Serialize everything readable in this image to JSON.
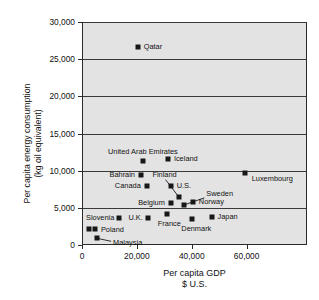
{
  "chart_data": {
    "type": "scatter",
    "title": "",
    "xlabel": "Per capita GDP",
    "xlabel_line2": "$ U.S.",
    "ylabel": "Per capita energy consumption",
    "ylabel_line2": "(kg oil equivalent)",
    "xlim": [
      0,
      82000
    ],
    "ylim": [
      0,
      30000
    ],
    "grid": "horizontal",
    "legend": "none",
    "xticks": [
      {
        "value": 0,
        "label": "0"
      },
      {
        "value": 20000,
        "label": "20,000"
      },
      {
        "value": 40000,
        "label": "40,000"
      },
      {
        "value": 60000,
        "label": "60,000"
      }
    ],
    "yticks": [
      {
        "value": 0,
        "label": "0"
      },
      {
        "value": 5000,
        "label": "5,000"
      },
      {
        "value": 10000,
        "label": "10,000"
      },
      {
        "value": 15000,
        "label": "15,000"
      },
      {
        "value": 20000,
        "label": "20,000"
      },
      {
        "value": 25000,
        "label": "25,000"
      },
      {
        "value": 30000,
        "label": "30,000"
      }
    ],
    "points": [
      {
        "name": "Qatar",
        "x": 20300,
        "y": 26700,
        "label": "Qatar",
        "label_pos": "l",
        "label_dx": 6,
        "label_dy": 0,
        "leader": null
      },
      {
        "name": "Iceland",
        "x": 31300,
        "y": 11600,
        "label": "Iceland",
        "label_pos": "l",
        "label_dx": 6,
        "label_dy": 0,
        "leader": null
      },
      {
        "name": "United Arab Emirates",
        "x": 22200,
        "y": 11250,
        "label": "United Arab Emirates",
        "label_pos": "c",
        "label_dx": 0,
        "label_dy": -9,
        "leader": null
      },
      {
        "name": "Luxembourg",
        "x": 59300,
        "y": 9650,
        "label": "Luxembourg",
        "label_pos": "l",
        "label_dx": 7,
        "label_dy": 6,
        "leader": null
      },
      {
        "name": "Bahrain",
        "x": 21500,
        "y": 9350,
        "label": "Bahrain",
        "label_pos": "r",
        "label_dx": -6,
        "label_dy": 0,
        "leader": null
      },
      {
        "name": "Canada",
        "x": 23600,
        "y": 8000,
        "label": "Canada",
        "label_pos": "r",
        "label_dx": -6,
        "label_dy": 0,
        "leader": null
      },
      {
        "name": "U.S.",
        "x": 32300,
        "y": 7900,
        "label": "U.S.",
        "label_pos": "l",
        "label_dx": 6,
        "label_dy": 0,
        "leader": null
      },
      {
        "name": "Finland",
        "x": 35200,
        "y": 6500,
        "label": "Finland",
        "label_pos": "c",
        "label_dx": -14,
        "label_dy": -22,
        "leader": "down-left"
      },
      {
        "name": "Belgium",
        "x": 32400,
        "y": 5600,
        "label": "Belgium",
        "label_pos": "r",
        "label_dx": -6,
        "label_dy": 0,
        "leader": null
      },
      {
        "name": "Sweden",
        "x": 37300,
        "y": 5400,
        "label": "Sweden",
        "label_pos": "l",
        "label_dx": 22,
        "label_dy": -11,
        "leader": "up-right"
      },
      {
        "name": "Norway",
        "x": 40400,
        "y": 5800,
        "label": "Norway",
        "label_pos": "l",
        "label_dx": 6,
        "label_dy": 0,
        "leader": null
      },
      {
        "name": "France",
        "x": 31100,
        "y": 4200,
        "label": "France",
        "label_pos": "c",
        "label_dx": 2,
        "label_dy": 10,
        "leader": null
      },
      {
        "name": "U.K.",
        "x": 24000,
        "y": 3650,
        "label": "U.K.",
        "label_pos": "r",
        "label_dx": -5,
        "label_dy": 0,
        "leader": null
      },
      {
        "name": "Slovenia",
        "x": 13600,
        "y": 3600,
        "label": "Slovenia",
        "label_pos": "r",
        "label_dx": -5,
        "label_dy": 0,
        "leader": null
      },
      {
        "name": "Japan",
        "x": 47200,
        "y": 3800,
        "label": "Japan",
        "label_pos": "l",
        "label_dx": 6,
        "label_dy": 0,
        "leader": null
      },
      {
        "name": "Denmark",
        "x": 40200,
        "y": 3500,
        "label": "Denmark",
        "label_pos": "c",
        "label_dx": 4,
        "label_dy": 10,
        "leader": null
      },
      {
        "name": "Poland",
        "x": 4700,
        "y": 2150,
        "label": "Poland",
        "label_pos": "l",
        "label_dx": 6,
        "label_dy": 1,
        "leader": null
      },
      {
        "name": "Poland2",
        "x": 2600,
        "y": 2100,
        "label": "",
        "label_pos": "l",
        "label_dx": 0,
        "label_dy": 0,
        "leader": null
      },
      {
        "name": "Malaysia",
        "x": 5500,
        "y": 900,
        "label": "Malaysia",
        "label_pos": "l",
        "label_dx": 16,
        "label_dy": 5,
        "leader": "up-left"
      }
    ]
  }
}
